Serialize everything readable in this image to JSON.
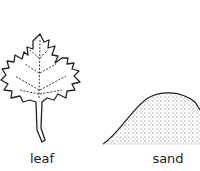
{
  "items": [
    {
      "name": "leaf",
      "label": "leaf",
      "icon": "leaf-icon"
    },
    {
      "name": "sand",
      "label": "sand",
      "icon": "sand-pile-icon"
    }
  ],
  "colors": {
    "ink": "#222222",
    "background": "#ffffff"
  }
}
